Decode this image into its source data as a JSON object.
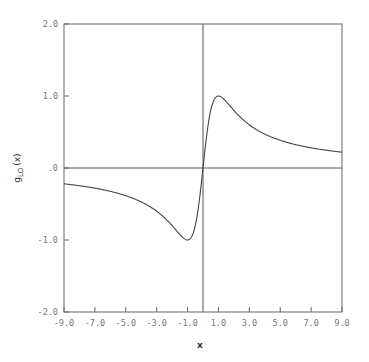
{
  "chart_data": {
    "type": "line",
    "title": "",
    "xlabel": "x",
    "ylabel": "g_LO(x)",
    "ylabel_main": "g",
    "ylabel_sub": "LO",
    "ylabel_suffix": "(x)",
    "xlim": [
      -9,
      9
    ],
    "ylim": [
      -2,
      2
    ],
    "grid": false,
    "legend": null,
    "x_ticks": [
      -9.0,
      -7.0,
      -5.0,
      -3.0,
      -1.0,
      1.0,
      3.0,
      5.0,
      7.0,
      9.0
    ],
    "x_tick_labels": [
      "-9.0",
      "-7.0",
      "-5.0",
      "-3.0",
      "-1.0",
      "1.0",
      "3.0",
      "5.0",
      "7.0",
      "9.0"
    ],
    "y_ticks": [
      2.0,
      1.0,
      0.0,
      -1.0,
      -2.0
    ],
    "y_tick_labels": [
      "2.0",
      "1.0",
      ".0",
      "-1.0",
      "-2.0"
    ],
    "reference_lines": {
      "horizontal_y": 0,
      "vertical_x": 0
    },
    "series": [
      {
        "name": "g_LO(x)",
        "x": [
          -9,
          -8,
          -7,
          -6,
          -5,
          -4,
          -3,
          -2.5,
          -2,
          -1.5,
          -1,
          -0.75,
          -0.5,
          -0.25,
          0,
          0.25,
          0.5,
          0.75,
          1,
          1.5,
          2,
          2.5,
          3,
          4,
          5,
          6,
          7,
          8,
          9
        ],
        "values": [
          -0.22,
          -0.246,
          -0.28,
          -0.324,
          -0.385,
          -0.471,
          -0.6,
          -0.69,
          -0.8,
          -0.923,
          -1.0,
          -0.96,
          -0.8,
          -0.47,
          0.0,
          0.47,
          0.8,
          0.96,
          1.0,
          0.923,
          0.8,
          0.69,
          0.6,
          0.471,
          0.385,
          0.324,
          0.28,
          0.246,
          0.22
        ]
      }
    ]
  }
}
